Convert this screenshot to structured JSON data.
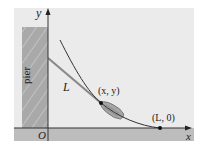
{
  "figure": {
    "type": "tractrix-boat-diagram",
    "colors": {
      "background": "#ffffff",
      "panel": "#ebebeb",
      "water": "#bdbdbd",
      "pier_fill": "#a9a9a9",
      "hatch": "#c4c4c4",
      "axis": "#333333",
      "curve": "#333333",
      "rope": "#8a8a8a",
      "boat": "#9e9e9e"
    },
    "labels": {
      "y_axis": "y",
      "x_axis": "x",
      "origin": "O",
      "pier": "pier",
      "rope_length": "L",
      "boat_point": "(x, y)",
      "end_point": "(L, 0)"
    },
    "points": [
      {
        "name": "boat_point",
        "label": "(x, y)"
      },
      {
        "name": "end_point",
        "label": "(L, 0)"
      }
    ]
  }
}
